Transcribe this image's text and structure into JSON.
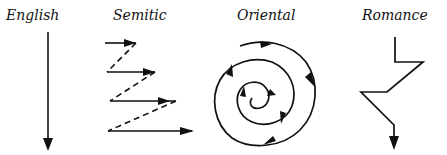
{
  "diagram": {
    "ink_color": "#111111",
    "background_color": "#ffffff",
    "panels": [
      {
        "id": "english",
        "label": "English",
        "pattern": "straight-down-arrow"
      },
      {
        "id": "semitic",
        "label": "Semitic",
        "pattern": "zigzag-parallel-arrows-dashed-returns"
      },
      {
        "id": "oriental",
        "label": "Oriental",
        "pattern": "inward-spiral-with-arrows"
      },
      {
        "id": "romance",
        "label": "Romance",
        "pattern": "digressive-zigzag-down-arrow"
      }
    ]
  }
}
